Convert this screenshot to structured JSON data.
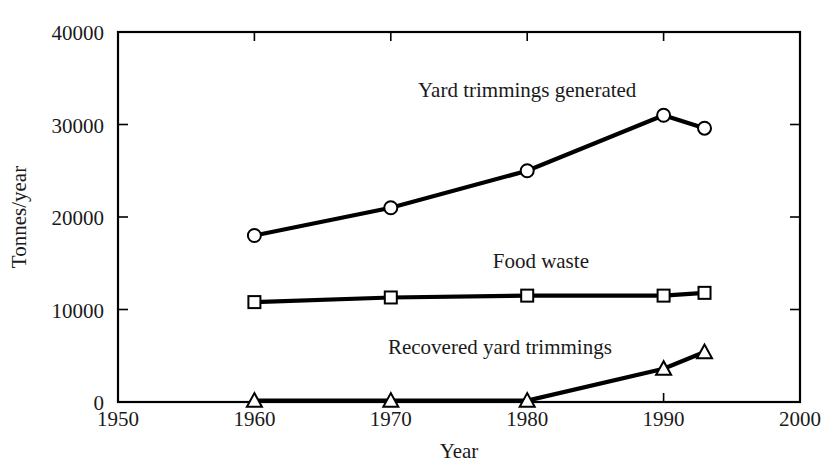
{
  "chart_data": {
    "type": "line",
    "title": "",
    "xlabel": "Year",
    "ylabel": "Tonnes/year",
    "xlim": [
      1950,
      2000
    ],
    "ylim": [
      0,
      40000
    ],
    "x_ticks": [
      1950,
      1960,
      1970,
      1980,
      1990,
      2000
    ],
    "y_ticks": [
      0,
      10000,
      20000,
      30000,
      40000
    ],
    "x_tick_labels": [
      "1950",
      "1960",
      "1970",
      "1980",
      "1990",
      "2000"
    ],
    "y_tick_labels": [
      "0",
      "10000",
      "20000",
      "30000",
      "40000"
    ],
    "grid": false,
    "legend": "inline-labels",
    "series": [
      {
        "name": "Yard trimmings generated",
        "marker": "circle-open",
        "x": [
          1960,
          1970,
          1980,
          1990,
          1993
        ],
        "values": [
          18000,
          21000,
          25000,
          31000,
          29600
        ],
        "label_x": 1980,
        "label_y": 33000
      },
      {
        "name": "Food waste",
        "marker": "square-open",
        "x": [
          1960,
          1970,
          1980,
          1990,
          1993
        ],
        "values": [
          10800,
          11300,
          11500,
          11500,
          11800
        ],
        "label_x": 1981,
        "label_y": 14500
      },
      {
        "name": "Recovered yard trimmings",
        "marker": "triangle-open",
        "x": [
          1960,
          1970,
          1980,
          1990,
          1993
        ],
        "values": [
          150,
          150,
          150,
          3600,
          5400
        ],
        "label_x": 1978,
        "label_y": 5200
      }
    ]
  },
  "axes": {
    "x_title": "Year",
    "y_title": "Tonnes/year"
  },
  "colors": {
    "line": "#000000",
    "marker_fill": "#ffffff",
    "text": "#1a1a1a",
    "background": "#ffffff"
  }
}
